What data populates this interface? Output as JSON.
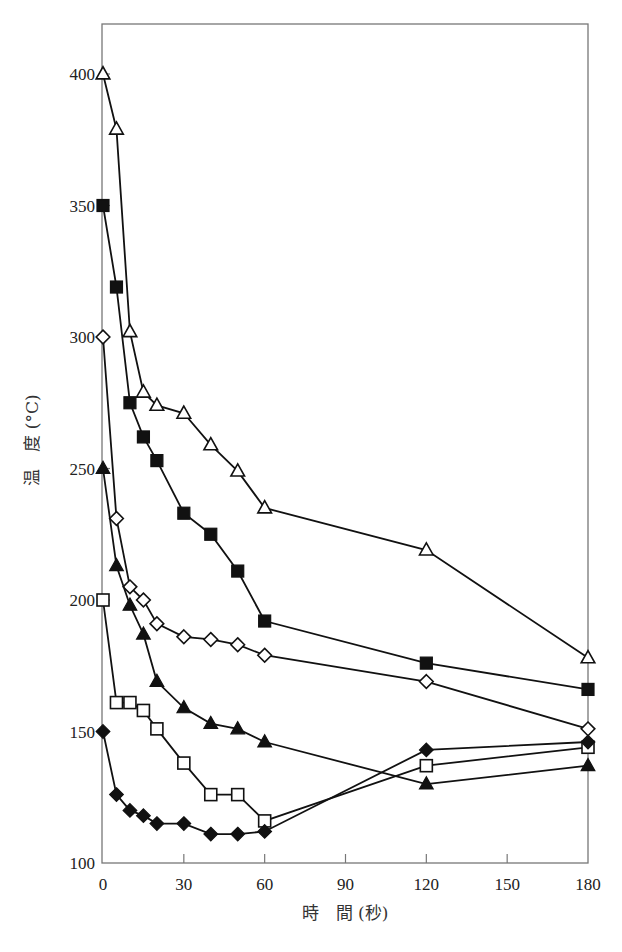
{
  "chart_data": {
    "type": "line",
    "title": "",
    "xlabel": "時　間 (秒)",
    "ylabel": "温　度 (°C)",
    "xlim": [
      0,
      180
    ],
    "ylim": [
      100,
      420
    ],
    "x_ticks": [
      0,
      30,
      60,
      90,
      120,
      150,
      180
    ],
    "y_ticks": [
      100,
      150,
      200,
      250,
      300,
      350,
      400
    ],
    "x_tick_labels": [
      "0",
      "30",
      "60",
      "90",
      "120",
      "150",
      "180"
    ],
    "y_tick_labels": [
      "100",
      "150",
      "200",
      "250",
      "300",
      "350",
      "400"
    ],
    "grid": false,
    "legend": "none",
    "x": [
      0,
      5,
      10,
      15,
      20,
      30,
      40,
      50,
      60,
      120,
      180
    ],
    "series": [
      {
        "name": "initial 400°C",
        "marker": "open-triangle",
        "values": [
          400,
          379,
          302,
          279,
          274,
          271,
          259,
          249,
          235,
          219,
          178
        ]
      },
      {
        "name": "initial 350°C",
        "marker": "filled-square",
        "values": [
          350,
          319,
          275,
          262,
          253,
          233,
          225,
          211,
          192,
          176,
          166
        ]
      },
      {
        "name": "initial 300°C",
        "marker": "open-diamond",
        "values": [
          300,
          231,
          205,
          200,
          191,
          186,
          185,
          183,
          179,
          169,
          151
        ]
      },
      {
        "name": "initial 250°C",
        "marker": "filled-triangle",
        "values": [
          250,
          213,
          198,
          187,
          169,
          159,
          153,
          151,
          146,
          130,
          137
        ]
      },
      {
        "name": "initial 200°C",
        "marker": "open-square",
        "values": [
          200,
          161,
          161,
          158,
          151,
          138,
          126,
          126,
          116,
          137,
          144
        ]
      },
      {
        "name": "initial 150°C",
        "marker": "filled-diamond",
        "values": [
          150,
          126,
          120,
          118,
          115,
          115,
          111,
          111,
          112,
          143,
          146
        ]
      }
    ]
  }
}
